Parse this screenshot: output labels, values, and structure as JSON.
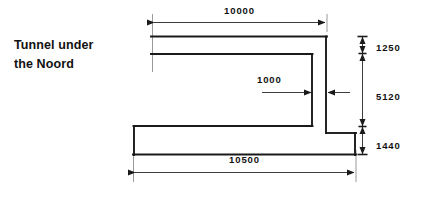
{
  "title": {
    "line1": "Tunnel under",
    "line2": "the Noord"
  },
  "dimensions": {
    "top_width": "10000",
    "bottom_width": "10500",
    "wall_thickness": "1000",
    "roof_height": "1250",
    "clear_height": "5120",
    "floor_height": "1440"
  },
  "style": {
    "line_color": "#1a1a1a",
    "background": "#ffffff"
  }
}
